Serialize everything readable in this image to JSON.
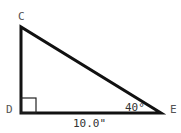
{
  "diagram": {
    "type": "right-triangle",
    "vertices": {
      "C": {
        "label": "C"
      },
      "D": {
        "label": "D"
      },
      "E": {
        "label": "E"
      }
    },
    "right_angle_at": "D",
    "angle_E": "40°",
    "side_DE": "10.0\"",
    "colors": {
      "stroke": "#111111",
      "label": "#555555"
    }
  }
}
